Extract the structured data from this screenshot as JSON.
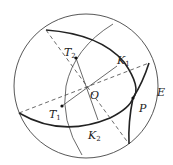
{
  "diagram": {
    "type": "celestial-sphere",
    "outer_circle": {
      "label": "E"
    },
    "points": {
      "O": {
        "label": "O"
      },
      "T1": {
        "label": "T",
        "sub": "1"
      },
      "T2": {
        "label": "T",
        "sub": "2"
      },
      "K1": {
        "label": "K",
        "sub": "1"
      },
      "K2": {
        "label": "K",
        "sub": "2"
      },
      "P": {
        "label": "P"
      }
    },
    "colors": {
      "stroke": "#333333",
      "background": "#ffffff"
    }
  }
}
